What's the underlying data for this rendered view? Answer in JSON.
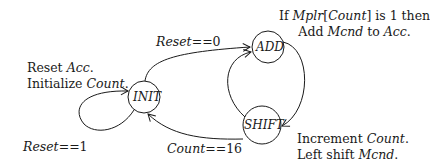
{
  "diagram": {
    "type": "state-machine",
    "states": [
      {
        "id": "init",
        "label": "INIT",
        "cx": 144,
        "cy": 97,
        "r": 16
      },
      {
        "id": "add",
        "label": "ADD",
        "cx": 268,
        "cy": 47,
        "r": 16
      },
      {
        "id": "shift",
        "label": "SHIFT",
        "cx": 262,
        "cy": 125,
        "r": 19
      }
    ],
    "transitions": [
      {
        "from": "INIT",
        "to": "INIT",
        "label": "Reset==1"
      },
      {
        "from": "INIT",
        "to": "ADD",
        "label": "Reset==0"
      },
      {
        "from": "ADD",
        "to": "SHIFT",
        "label": ""
      },
      {
        "from": "SHIFT",
        "to": "ADD",
        "label": ""
      },
      {
        "from": "SHIFT",
        "to": "INIT",
        "label": "Count==16"
      }
    ],
    "annotations": {
      "init": {
        "line1_plain": "Reset ",
        "line1_ital": "Acc",
        "line1_end": ".",
        "line2_plain": "Initialize ",
        "line2_ital": "Count",
        "line2_end": "."
      },
      "add": {
        "line1_a": "If ",
        "line1_b": "Mplr",
        "line1_c": "[",
        "line1_d": "Count",
        "line1_e": "] is 1 then",
        "line2_a": "Add ",
        "line2_b": "Mcnd",
        "line2_c": " to ",
        "line2_d": "Acc",
        "line2_e": "."
      },
      "shift": {
        "line1_plain": "Increment ",
        "line1_ital": "Count",
        "line1_end": ".",
        "line2_plain": "Left shift ",
        "line2_ital": "Mcnd",
        "line2_end": "."
      }
    },
    "edge_labels": {
      "reset0_a": "Reset",
      "reset0_b": "==0",
      "reset1_a": "Reset",
      "reset1_b": "==1",
      "count16_a": "Count",
      "count16_b": "==16"
    }
  }
}
